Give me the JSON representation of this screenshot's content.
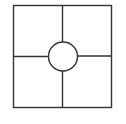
{
  "diagram": {
    "type": "square-divided-into-quadrants-with-center-circle",
    "stroke_color": "#333333",
    "background": "#ffffff",
    "outer_square": {
      "x": 13,
      "y": 5,
      "width": 99,
      "height": 103
    },
    "vertical_divider": {
      "x": 62.5
    },
    "horizontal_divider": {
      "y": 56.5
    },
    "center_circle": {
      "cx": 63,
      "cy": 56.5,
      "r": 14.5
    }
  }
}
